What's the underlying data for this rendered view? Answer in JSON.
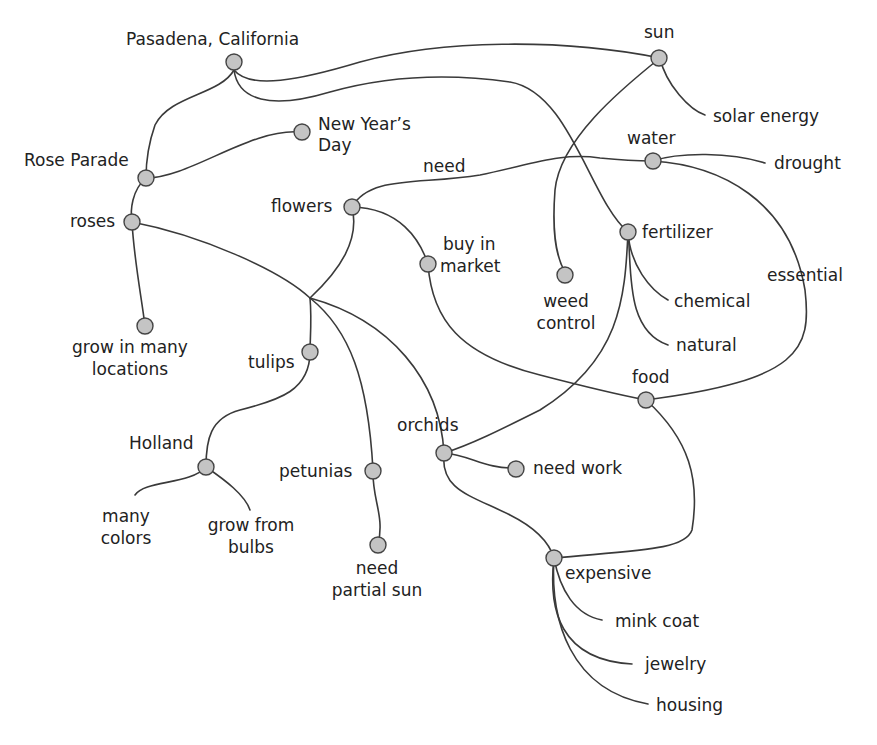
{
  "diagram": {
    "type": "concept-map",
    "colors": {
      "node_fill": "#c4c4c4",
      "node_stroke": "#444444",
      "edge": "#3a3a3a",
      "text": "#222222",
      "background": "#ffffff"
    },
    "nodes": {
      "pasadena": "Pasadena, California",
      "sun": "sun",
      "solar_energy": "solar energy",
      "new_years_1": "New Year’s",
      "new_years_2": "Day",
      "rose_parade": "Rose Parade",
      "water": "water",
      "drought": "drought",
      "need": "need",
      "flowers": "flowers",
      "roses": "roses",
      "fertilizer": "fertilizer",
      "buy_in_1": "buy in",
      "buy_in_2": "market",
      "essential": "essential",
      "weed_1": "weed",
      "weed_2": "control",
      "chemical": "chemical",
      "grow_many_1": "grow in many",
      "grow_many_2": "locations",
      "natural": "natural",
      "tulips": "tulips",
      "food": "food",
      "orchids": "orchids",
      "holland": "Holland",
      "petunias": "petunias",
      "need_work": "need work",
      "many_colors_1": "many",
      "many_colors_2": "colors",
      "bulbs_1": "grow from",
      "bulbs_2": "bulbs",
      "partial_1": "need",
      "partial_2": "partial sun",
      "expensive": "expensive",
      "mink_coat": "mink coat",
      "jewelry": "jewelry",
      "housing": "housing"
    }
  }
}
